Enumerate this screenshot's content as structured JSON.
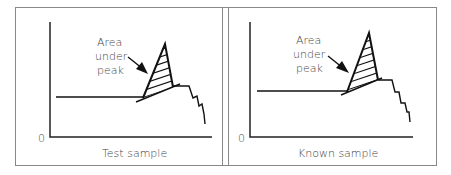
{
  "panels": [
    {
      "id": "test",
      "caption": "Test sample",
      "origin_label": "0",
      "annotation": [
        "Area",
        "under",
        "peak"
      ]
    },
    {
      "id": "known",
      "caption": "Known sample",
      "origin_label": "0",
      "annotation": [
        "Area",
        "under",
        "peak"
      ]
    }
  ],
  "colors": {
    "line": "#111111",
    "frame": "#888888",
    "text": "#444444"
  }
}
